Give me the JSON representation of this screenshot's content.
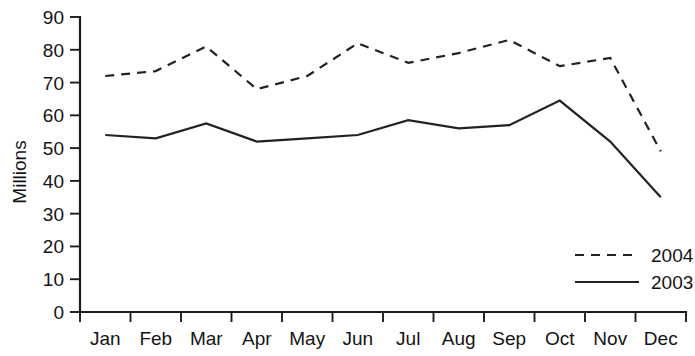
{
  "chart_data": {
    "type": "line",
    "title": "",
    "subtitle": "",
    "xlabel": "",
    "ylabel": "Millions",
    "categories": [
      "Jan",
      "Feb",
      "Mar",
      "Apr",
      "May",
      "Jun",
      "Jul",
      "Aug",
      "Sep",
      "Oct",
      "Nov",
      "Dec"
    ],
    "series": [
      {
        "name": "2004",
        "style": "dashed",
        "color": "#222222",
        "values": [
          72,
          73.5,
          81,
          68,
          72,
          82,
          76,
          79,
          83,
          75,
          77.5,
          49
        ]
      },
      {
        "name": "2003",
        "style": "solid",
        "color": "#222222",
        "values": [
          54,
          53,
          57.5,
          52,
          53,
          54,
          58.5,
          56,
          57,
          64.5,
          52,
          35
        ]
      }
    ],
    "ylim": [
      0,
      90
    ],
    "ytick_values": [
      0,
      10,
      20,
      30,
      40,
      50,
      60,
      70,
      80,
      90
    ],
    "ytick_labels": [
      "0",
      "10",
      "20",
      "30",
      "40",
      "50",
      "60",
      "70",
      "80",
      "90"
    ],
    "grid": false,
    "legend_position": "bottom-right",
    "legend_entries": [
      "2004",
      "2003"
    ]
  },
  "axes": {
    "y_title": "Millions"
  },
  "legend": {
    "items": [
      {
        "label": "2004"
      },
      {
        "label": "2003"
      }
    ]
  }
}
